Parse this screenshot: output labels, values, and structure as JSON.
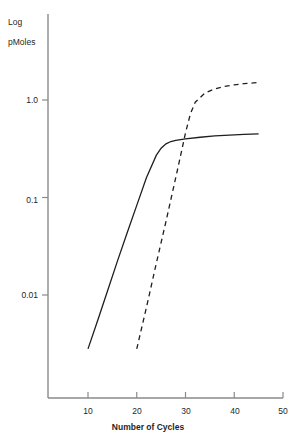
{
  "chart_data": {
    "type": "line",
    "title": "",
    "xlabel": "Number of Cycles",
    "ylabel": "Log pMoles",
    "ylabel_line1": "Log",
    "ylabel_line2": "pMoles",
    "yscale": "log",
    "xlim": [
      5,
      52
    ],
    "ylim": [
      0.002,
      2.6
    ],
    "grid": false,
    "legend": false,
    "xticks": [
      10,
      20,
      30,
      40,
      50
    ],
    "xticklabels": [
      "10",
      "20",
      "30",
      "40",
      "50"
    ],
    "yticks": [
      1.0,
      0.1,
      0.01
    ],
    "yticklabels": [
      "1.0",
      "0.1",
      "0.01"
    ],
    "series": [
      {
        "name": "solid-curve",
        "style": "solid",
        "color": "#1f1f1f",
        "x": [
          10,
          12,
          14,
          16,
          18,
          20,
          22,
          24,
          25,
          26,
          27,
          28,
          30,
          33,
          36,
          39,
          42,
          45
        ],
        "y": [
          0.0028,
          0.0055,
          0.011,
          0.022,
          0.043,
          0.083,
          0.16,
          0.27,
          0.32,
          0.355,
          0.375,
          0.385,
          0.4,
          0.415,
          0.428,
          0.437,
          0.444,
          0.45
        ]
      },
      {
        "name": "dashed-curve",
        "style": "dashed",
        "color": "#1f1f1f",
        "x": [
          20,
          22,
          24,
          26,
          28,
          29,
          30,
          31,
          32,
          34,
          36,
          38,
          40,
          42,
          44,
          45
        ],
        "y": [
          0.0028,
          0.0075,
          0.021,
          0.057,
          0.16,
          0.27,
          0.46,
          0.72,
          0.95,
          1.18,
          1.3,
          1.38,
          1.43,
          1.47,
          1.5,
          1.51
        ]
      }
    ]
  },
  "axes": {
    "axis_color": "#8a8a8a",
    "curve_color": "#1f1f1f"
  }
}
